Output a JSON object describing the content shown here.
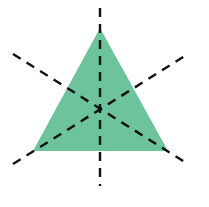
{
  "figure": {
    "shape": "equilateral-triangle",
    "fill_color": "#6dc39c",
    "line_color": "#111111",
    "line_style": "dashed",
    "lines_of_symmetry": 3,
    "vertices": [
      [
        100,
        28
      ],
      [
        33,
        151
      ],
      [
        168,
        151
      ]
    ],
    "center": [
      100,
      110
    ],
    "symmetry_lines": [
      {
        "name": "vertical",
        "x1": 100,
        "y1": 8,
        "x2": 100,
        "y2": 186
      },
      {
        "name": "diagonal-down",
        "x1": 13,
        "y1": 54,
        "x2": 188,
        "y2": 164
      },
      {
        "name": "diagonal-up",
        "x1": 13,
        "y1": 164,
        "x2": 188,
        "y2": 54
      }
    ]
  }
}
